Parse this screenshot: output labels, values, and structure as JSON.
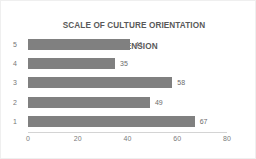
{
  "chart_data": {
    "type": "bar",
    "orientation": "horizontal",
    "title": "SCALE OF CULTURE ORIENTATION\nDIMENSION",
    "title_line1": "SCALE OF CULTURE ORIENTATION",
    "title_line2": "DIMENSION",
    "xlabel": "",
    "ylabel": "",
    "categories": [
      "5",
      "4",
      "3",
      "2",
      "1"
    ],
    "values": [
      41,
      35,
      58,
      49,
      67
    ],
    "data_labels": [
      "41",
      "35",
      "58",
      "49",
      "67"
    ],
    "xlim": [
      0,
      80
    ],
    "xticks": [
      0,
      20,
      40,
      60,
      80
    ],
    "xtick_labels": [
      "0",
      "20",
      "40",
      "60",
      "80"
    ],
    "grid": false,
    "legend": false,
    "bar_color": "#808080",
    "title_color": "#595959",
    "axis_text_color": "#777777",
    "plot_background": "#ffffff",
    "border_color": "#efefef"
  }
}
